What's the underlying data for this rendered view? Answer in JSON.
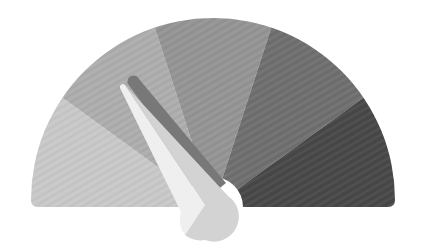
{
  "gauge": {
    "label": "",
    "center": {
      "x": 213,
      "y": 207
    },
    "outer_radius": 182,
    "inner_radius": 30,
    "segments": [
      {
        "name": "segment-1",
        "color": "#c8c8c8",
        "start_deg": 180,
        "end_deg": 144
      },
      {
        "name": "segment-2",
        "color": "#adadad",
        "start_deg": 144,
        "end_deg": 108
      },
      {
        "name": "segment-3",
        "color": "#949494",
        "start_deg": 108,
        "end_deg": 72
      },
      {
        "name": "segment-4",
        "color": "#6f6f6f",
        "start_deg": 72,
        "end_deg": 36
      },
      {
        "name": "segment-5",
        "color": "#484848",
        "start_deg": 36,
        "end_deg": 0
      }
    ],
    "needle": {
      "angle_deg": 120,
      "light_color_left": "#efefef",
      "light_color_right": "#d3d3d3",
      "shadow_color": "#787878"
    }
  }
}
